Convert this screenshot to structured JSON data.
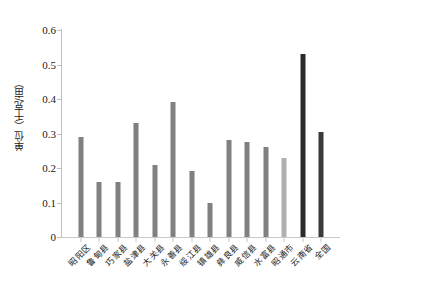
{
  "chart_data": {
    "type": "bar",
    "title": "",
    "subtitle": "",
    "xlabel": "",
    "ylabel": "单位（千克/亩）",
    "ylim": [
      0,
      0.6
    ],
    "ytick_step": 0.1,
    "ytick_labels": [
      "0.6",
      "0.5",
      "0.4",
      "0.3",
      "0.2",
      "0.1",
      "0"
    ],
    "ytick_values": [
      0.6,
      0.5,
      0.4,
      0.3,
      0.2,
      0.1,
      0
    ],
    "grid": false,
    "legend": null,
    "legend_position": "none",
    "categories": [
      "昭阳区",
      "鲁甸县",
      "巧家县",
      "盐津县",
      "大关县",
      "永善县",
      "绥江县",
      "镇雄县",
      "彝良县",
      "威信县",
      "水富县",
      "昭通市",
      "云南省",
      "全国"
    ],
    "values": [
      0.29,
      0.16,
      0.16,
      0.33,
      0.21,
      0.39,
      0.19,
      0.1,
      0.28,
      0.275,
      0.26,
      0.23,
      0.53,
      0.305
    ],
    "bar_colors": [
      "#808080",
      "#808080",
      "#808080",
      "#808080",
      "#808080",
      "#808080",
      "#808080",
      "#808080",
      "#808080",
      "#808080",
      "#808080",
      "#b0b0b0",
      "#2b2b2b",
      "#3a3a3a"
    ]
  },
  "colors": {
    "county_bar": "#808080",
    "city_bar": "#b0b0b0",
    "province_bar": "#2b2b2b",
    "national_bar": "#3a3a3a",
    "axis": "#c0c0c0",
    "text": "#1a1a1a",
    "background": "#ffffff"
  }
}
